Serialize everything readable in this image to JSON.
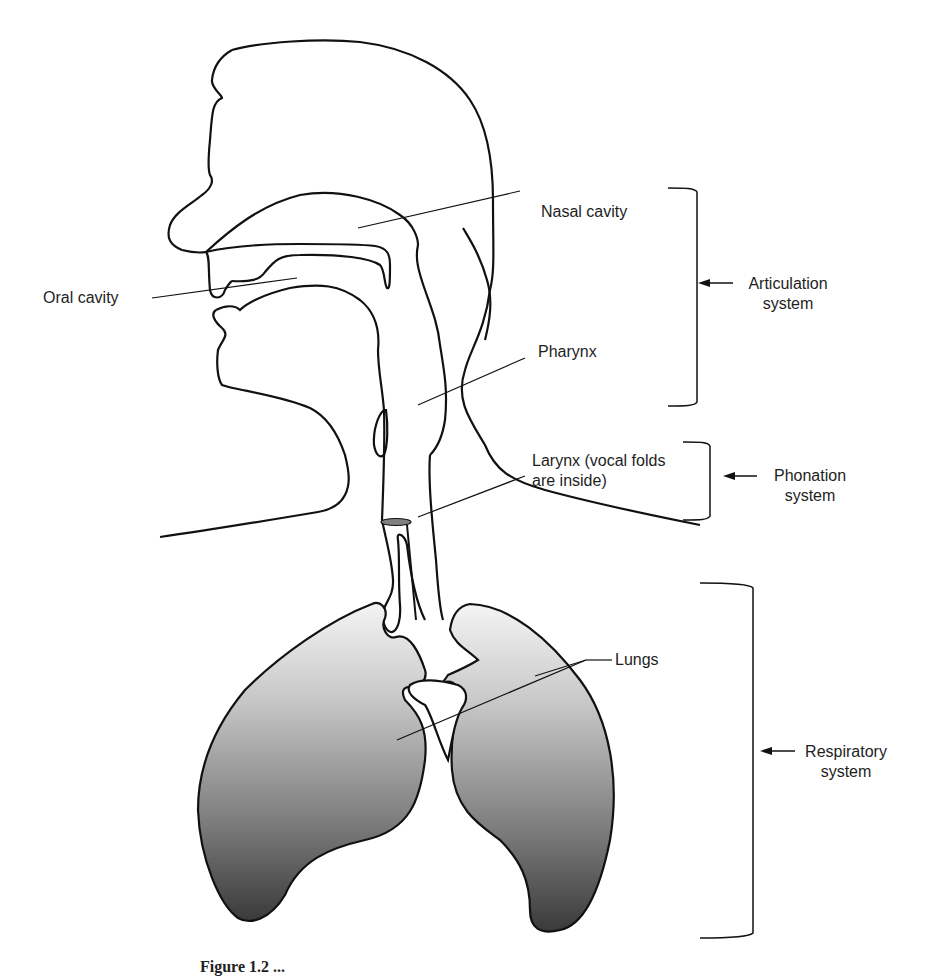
{
  "figure": {
    "caption_partial": "Figure 1.2 ...",
    "caption_note": "caption cropped at bottom edge"
  },
  "labels": {
    "nasal_cavity": "Nasal cavity",
    "oral_cavity": "Oral cavity",
    "pharynx": "Pharynx",
    "larynx_line1": "Larynx (vocal folds",
    "larynx_line2": "are inside)",
    "lungs": "Lungs"
  },
  "systems": {
    "articulation": {
      "line1": "Articulation",
      "line2": "system"
    },
    "phonation": {
      "line1": "Phonation",
      "line2": "system"
    },
    "respiratory": {
      "line1": "Respiratory",
      "line2": "system"
    }
  },
  "colors": {
    "outline": "#111111",
    "lung_gradient_top": "#f2f2f2",
    "lung_gradient_bottom": "#3a3a3a",
    "vocal_fold_fill": "#808080"
  }
}
